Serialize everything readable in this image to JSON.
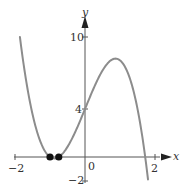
{
  "chart_data": {
    "type": "line",
    "title": "",
    "xlabel": "x",
    "ylabel": "y",
    "xlim": [
      -2,
      2
    ],
    "ylim": [
      -2,
      10
    ],
    "x_ticks": [
      "-2",
      "0",
      "2"
    ],
    "y_ticks": [
      "10",
      "4",
      "-2"
    ],
    "grid": false,
    "series": [
      {
        "name": "curve",
        "x": [
          -1.86,
          -1.7,
          -1.5,
          -1.3,
          -1.1,
          -1.0,
          -0.875,
          -0.75,
          -0.6,
          -0.4,
          -0.2,
          0.0,
          0.2,
          0.4,
          0.6,
          0.83,
          1.0,
          1.2,
          1.4,
          1.6,
          1.72,
          1.8
        ],
        "y": [
          9.9,
          6.6,
          3.4,
          1.2,
          0.15,
          0.0,
          -0.05,
          0.0,
          0.45,
          1.55,
          2.75,
          4.0,
          5.3,
          6.5,
          7.5,
          8.15,
          8.0,
          7.0,
          5.0,
          2.0,
          0.0,
          -1.8
        ]
      }
    ],
    "marked_points": [
      {
        "x": -1.0,
        "y": 0
      },
      {
        "x": -0.75,
        "y": 0
      }
    ],
    "annotations": []
  },
  "labels": {
    "x_axis": "x",
    "y_axis": "y",
    "tick_x_neg2": "−2",
    "tick_x_0": "0",
    "tick_x_2": "2",
    "tick_y_10": "10",
    "tick_y_4": "4",
    "tick_y_neg2": "−2"
  },
  "colors": {
    "curve": "#8c8c8c",
    "axis": "#555555",
    "point": "#111111"
  }
}
